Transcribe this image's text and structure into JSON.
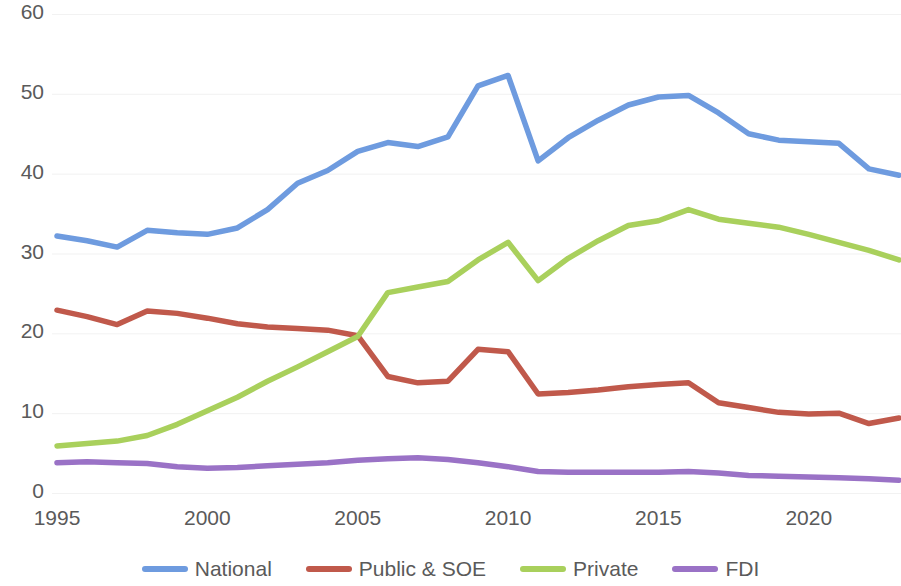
{
  "chart_data": {
    "type": "line",
    "title": "",
    "xlabel": "",
    "ylabel": "",
    "xlim": [
      1995,
      2023
    ],
    "ylim": [
      0,
      60
    ],
    "grid": true,
    "legend_position": "bottom",
    "x_tick_labels": [
      "1995",
      "2000",
      "2005",
      "2010",
      "2015",
      "2020"
    ],
    "x_tick_values": [
      1995,
      2000,
      2005,
      2010,
      2015,
      2020
    ],
    "y_tick_labels": [
      "0",
      "10",
      "20",
      "30",
      "40",
      "50",
      "60"
    ],
    "y_tick_values": [
      0,
      10,
      20,
      30,
      40,
      50,
      60
    ],
    "x": [
      1995,
      1996,
      1997,
      1998,
      1999,
      2000,
      2001,
      2002,
      2003,
      2004,
      2005,
      2006,
      2007,
      2008,
      2009,
      2010,
      2011,
      2012,
      2013,
      2014,
      2015,
      2016,
      2017,
      2018,
      2019,
      2020,
      2021,
      2022,
      2023
    ],
    "series": [
      {
        "name": "National",
        "color": "#6e9bdf",
        "values": [
          32.2,
          31.6,
          30.8,
          32.9,
          32.6,
          32.4,
          33.2,
          35.5,
          38.8,
          40.4,
          42.8,
          43.9,
          43.4,
          44.6,
          51.0,
          52.3,
          41.6,
          44.5,
          46.7,
          48.6,
          49.6,
          49.8,
          47.6,
          45.0,
          44.2,
          44.0,
          43.8,
          40.6,
          39.8
        ]
      },
      {
        "name": "Public & SOE",
        "color": "#c0594b",
        "values": [
          22.9,
          22.1,
          21.1,
          22.8,
          22.5,
          21.9,
          21.2,
          20.8,
          20.6,
          20.4,
          19.7,
          14.6,
          13.8,
          14.0,
          18.0,
          17.7,
          12.4,
          12.6,
          12.9,
          13.3,
          13.6,
          13.8,
          11.3,
          10.7,
          10.1,
          9.9,
          10.0,
          8.7,
          9.4
        ]
      },
      {
        "name": "Private",
        "color": "#a9d05c",
        "values": [
          5.9,
          6.2,
          6.5,
          7.2,
          8.6,
          10.3,
          12.0,
          14.0,
          15.8,
          17.7,
          19.6,
          25.1,
          25.8,
          26.5,
          29.2,
          31.4,
          26.6,
          29.4,
          31.6,
          33.5,
          34.1,
          35.5,
          34.3,
          33.8,
          33.3,
          32.4,
          31.4,
          30.4,
          29.2
        ]
      },
      {
        "name": "FDI",
        "color": "#9a72c6",
        "values": [
          3.8,
          3.9,
          3.8,
          3.7,
          3.3,
          3.1,
          3.2,
          3.4,
          3.6,
          3.8,
          4.1,
          4.3,
          4.4,
          4.2,
          3.8,
          3.3,
          2.7,
          2.6,
          2.6,
          2.6,
          2.6,
          2.7,
          2.5,
          2.2,
          2.1,
          2.0,
          1.9,
          1.8,
          1.6
        ]
      }
    ]
  },
  "legend": {
    "items": [
      {
        "label": "National",
        "color": "#6e9bdf"
      },
      {
        "label": "Public & SOE",
        "color": "#c0594b"
      },
      {
        "label": "Private",
        "color": "#a9d05c"
      },
      {
        "label": "FDI",
        "color": "#9a72c6"
      }
    ]
  }
}
